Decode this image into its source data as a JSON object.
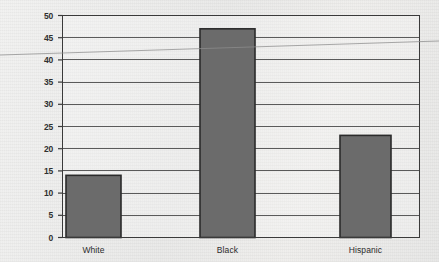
{
  "chart_data": {
    "type": "bar",
    "title": "",
    "subtitle": "",
    "xlabel": "",
    "ylabel": "",
    "categories": [
      "White",
      "Black",
      "Hispanic"
    ],
    "values": [
      14,
      47,
      23
    ],
    "series": [
      {
        "name": "",
        "values": [
          14,
          47,
          23
        ]
      }
    ],
    "ylim": [
      0,
      50
    ],
    "yticks": [
      0,
      5,
      10,
      15,
      20,
      25,
      30,
      35,
      40,
      45,
      50
    ],
    "ytick_labels": [
      "0",
      "5",
      "10",
      "15",
      "20",
      "25",
      "30",
      "35",
      "40",
      "45",
      "50"
    ],
    "grid": true,
    "grid_axis": "y",
    "legend": false,
    "legend_position": "none",
    "annotations": [],
    "colors": {
      "bar_fill": "#6b6b6b",
      "bar_border": "#2b2b2b",
      "gridline": "#555555",
      "frame": "#3a3a3a",
      "background": "#ecebe9",
      "text": "#2b2b2b"
    }
  },
  "axes": {
    "y": {
      "ticks": [
        {
          "value": 50,
          "label": "50"
        },
        {
          "value": 45,
          "label": "45"
        },
        {
          "value": 40,
          "label": "40"
        },
        {
          "value": 35,
          "label": "35"
        },
        {
          "value": 30,
          "label": "30"
        },
        {
          "value": 25,
          "label": "25"
        },
        {
          "value": 20,
          "label": "20"
        },
        {
          "value": 15,
          "label": "15"
        },
        {
          "value": 10,
          "label": "10"
        },
        {
          "value": 5,
          "label": "5"
        },
        {
          "value": 0,
          "label": "0"
        }
      ]
    },
    "x": {
      "ticks": [
        {
          "label": "White"
        },
        {
          "label": "Black"
        },
        {
          "label": "Hispanic"
        }
      ]
    }
  },
  "bars": [
    {
      "category": "White",
      "value": 14
    },
    {
      "category": "Black",
      "value": 47
    },
    {
      "category": "Hispanic",
      "value": 23
    }
  ]
}
